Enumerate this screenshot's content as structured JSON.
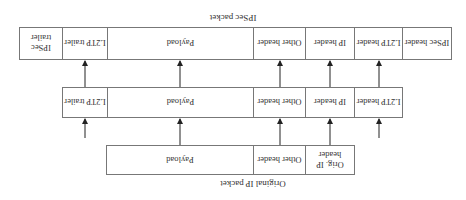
{
  "orientation": "rotated 180 degrees",
  "ipsec_packet": {
    "title": "IPSec packet",
    "fields": [
      {
        "label": "IPSec header"
      },
      {
        "label": "L2TP header"
      },
      {
        "label": "IP header"
      },
      {
        "label": "Other header"
      },
      {
        "label": "Payload"
      },
      {
        "label": "L2TP trailer"
      },
      {
        "label": "IPSec trailer"
      }
    ]
  },
  "l2tp_packet": {
    "fields": [
      {
        "label": "L2TP header"
      },
      {
        "label": "IP header"
      },
      {
        "label": "Other header"
      },
      {
        "label": "Payload"
      },
      {
        "label": "L2TP trailer"
      }
    ]
  },
  "original_packet": {
    "title": "Original IP packet",
    "fields": [
      {
        "label": "Orig. IP header"
      },
      {
        "label": "Other header"
      },
      {
        "label": "Payload"
      }
    ]
  }
}
